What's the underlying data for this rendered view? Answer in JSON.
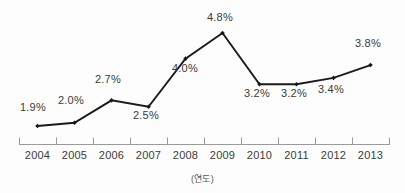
{
  "chart_data": {
    "type": "line",
    "title": "",
    "subtitle": "",
    "xlabel": "(연도)",
    "ylabel": "",
    "categories": [
      "2004",
      "2005",
      "2006",
      "2007",
      "2008",
      "2009",
      "2010",
      "2011",
      "2012",
      "2013"
    ],
    "values": [
      1.9,
      2.0,
      2.7,
      2.5,
      4.0,
      4.8,
      3.2,
      3.2,
      3.4,
      3.8
    ],
    "point_labels": [
      "1.9%",
      "2.0%",
      "2.7%",
      "2.5%",
      "4.0%",
      "4.8%",
      "3.2%",
      "3.2%",
      "3.4%",
      "3.8%"
    ],
    "label_positions": [
      "above",
      "above",
      "above",
      "below",
      "above",
      "above",
      "below",
      "below",
      "below",
      "above"
    ],
    "ylim": [
      0,
      5.2
    ],
    "grid": false,
    "legend": null,
    "series": [
      {
        "name": "",
        "values": [
          1.9,
          2.0,
          2.7,
          2.5,
          4.0,
          4.8,
          3.2,
          3.2,
          3.4,
          3.8
        ],
        "color": "#1a1a1a",
        "marker": "diamond"
      }
    ],
    "axis": {
      "x_axis_visible": true,
      "y_axis_visible": false,
      "tick_direction": "up",
      "axis_color": "#9a9a9a"
    }
  },
  "colors": {
    "line": "#1a1a1a",
    "marker": "#111111",
    "text": "#3a3a3a",
    "axis": "#9a9a9a",
    "background": "#fdfdfd"
  }
}
